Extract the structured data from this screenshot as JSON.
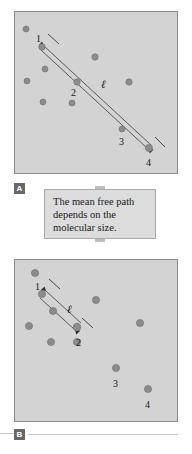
{
  "figure": {
    "type": "two-panel physics diagram",
    "background_color": "#ffffff",
    "panel_fill": "#d3d3d3",
    "panel_border": "#8a8a8a",
    "molecule_color": "#8c8c8c",
    "molecule_stroke": "#6e6e6e",
    "line_color": "#333333"
  },
  "panel_a": {
    "badge": "A",
    "molecules": [
      {
        "id": "m1",
        "label": "1",
        "cx": 27,
        "cy": 35,
        "r": 3.2,
        "label_dx": -6,
        "label_dy": -13
      },
      {
        "id": "m2",
        "label": "2",
        "cx": 62,
        "cy": 70,
        "r": 3.2,
        "label_dx": -6,
        "label_dy": 6
      },
      {
        "id": "m3",
        "label": "3",
        "cx": 107,
        "cy": 117,
        "r": 3.0,
        "label_dx": -3,
        "label_dy": 8
      },
      {
        "id": "m4",
        "label": "4",
        "cx": 134,
        "cy": 136,
        "r": 3.6,
        "label_dx": -3,
        "label_dy": 10
      },
      {
        "id": "d1",
        "label": "",
        "cx": 11,
        "cy": 17,
        "r": 3.0
      },
      {
        "id": "d2",
        "label": "",
        "cx": 30,
        "cy": 57,
        "r": 3.0
      },
      {
        "id": "d3",
        "label": "",
        "cx": 12,
        "cy": 69,
        "r": 3.0
      },
      {
        "id": "d4",
        "label": "",
        "cx": 28,
        "cy": 90,
        "r": 3.0
      },
      {
        "id": "d5",
        "label": "",
        "cx": 57,
        "cy": 91,
        "r": 3.0
      },
      {
        "id": "d6",
        "label": "",
        "cx": 80,
        "cy": 45,
        "r": 3.2
      },
      {
        "id": "d7",
        "label": "",
        "cx": 114,
        "cy": 70,
        "r": 3.2
      }
    ],
    "path": {
      "label": "ℓ",
      "from": "1",
      "to": "4",
      "label_x": 86,
      "label_y": 67
    }
  },
  "callout": {
    "text": "The mean free path\ndepends on the\nmolecular size."
  },
  "panel_b": {
    "badge": "B",
    "molecules": [
      {
        "id": "m1",
        "label": "1",
        "cx": 27,
        "cy": 34,
        "r": 3.6,
        "label_dx": -7,
        "label_dy": -12
      },
      {
        "id": "m2",
        "label": "2",
        "cx": 62,
        "cy": 67,
        "r": 3.8,
        "label_dx": -1,
        "label_dy": 11
      },
      {
        "id": "m3",
        "label": "3",
        "cx": 101,
        "cy": 108,
        "r": 3.6,
        "label_dx": -3,
        "label_dy": 11
      },
      {
        "id": "m4",
        "label": "4",
        "cx": 133,
        "cy": 129,
        "r": 3.6,
        "label_dx": -3,
        "label_dy": 11
      },
      {
        "id": "d1",
        "label": "",
        "cx": 20,
        "cy": 13,
        "r": 3.6
      },
      {
        "id": "d2",
        "label": "",
        "cx": 38,
        "cy": 51,
        "r": 3.6
      },
      {
        "id": "d3",
        "label": "",
        "cx": 14,
        "cy": 66,
        "r": 3.6
      },
      {
        "id": "d4",
        "label": "",
        "cx": 36,
        "cy": 82,
        "r": 3.6
      },
      {
        "id": "d5",
        "label": "",
        "cx": 62,
        "cy": 82,
        "r": 3.6
      },
      {
        "id": "d6",
        "label": "",
        "cx": 81,
        "cy": 40,
        "r": 3.6
      },
      {
        "id": "d7",
        "label": "",
        "cx": 125,
        "cy": 63,
        "r": 3.6
      }
    ],
    "path": {
      "label": "ℓ",
      "from": "1",
      "to": "2",
      "label_x": 52,
      "label_y": 44
    }
  }
}
